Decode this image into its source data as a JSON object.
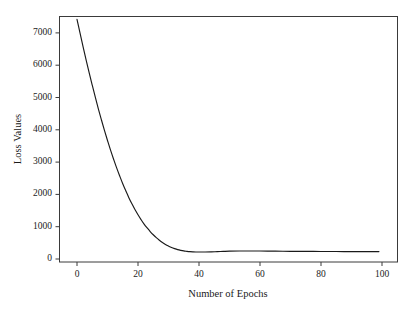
{
  "figure": {
    "background_color": "#ffffff",
    "line_color": "#1a1a1a",
    "axis_color": "#3a3a3a"
  },
  "axis": {
    "x_title": "Number of Epochs",
    "y_title": "Loss Values",
    "x_ticks": [
      "0",
      "20",
      "40",
      "60",
      "80",
      "100"
    ],
    "y_ticks": [
      "0",
      "1000",
      "2000",
      "3000",
      "4000",
      "5000",
      "6000",
      "7000"
    ]
  },
  "chart_data": {
    "type": "line",
    "title": "",
    "xlabel": "Number of Epochs",
    "ylabel": "Loss Values",
    "xlim": [
      0,
      100
    ],
    "ylim": [
      0,
      7600
    ],
    "grid": false,
    "legend": null,
    "xticks": [
      0,
      20,
      40,
      60,
      80,
      100
    ],
    "yticks": [
      0,
      1000,
      2000,
      3000,
      4000,
      5000,
      6000,
      7000
    ],
    "series": [
      {
        "name": "Loss",
        "color": "#1a1a1a",
        "x": [
          0,
          1,
          2,
          3,
          4,
          5,
          6,
          7,
          8,
          9,
          10,
          11,
          12,
          13,
          14,
          15,
          16,
          17,
          18,
          19,
          20,
          21,
          22,
          23,
          24,
          25,
          26,
          27,
          28,
          29,
          30,
          31,
          32,
          33,
          34,
          35,
          36,
          37,
          38,
          39,
          40,
          42,
          44,
          46,
          48,
          50,
          55,
          60,
          65,
          70,
          75,
          80,
          85,
          90,
          95,
          99
        ],
        "y": [
          7420,
          6990,
          6570,
          6160,
          5760,
          5380,
          5010,
          4650,
          4310,
          3980,
          3670,
          3370,
          3090,
          2820,
          2570,
          2330,
          2110,
          1900,
          1710,
          1530,
          1370,
          1220,
          1080,
          960,
          850,
          750,
          660,
          580,
          510,
          450,
          400,
          355,
          320,
          290,
          268,
          250,
          238,
          228,
          222,
          218,
          216,
          216,
          220,
          228,
          236,
          243,
          248,
          246,
          242,
          238,
          235,
          233,
          231,
          230,
          229,
          229
        ]
      }
    ]
  }
}
